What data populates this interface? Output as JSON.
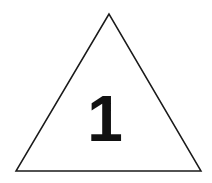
{
  "diagram": {
    "shape": "triangle",
    "label": "1",
    "stroke_color": "#1a1a1a",
    "fill_color": "#ffffff",
    "text_color": "#111111"
  }
}
